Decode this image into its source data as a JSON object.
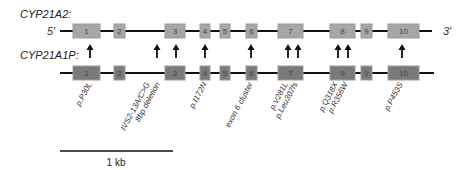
{
  "genes": [
    {
      "name": "CYP21A2:",
      "five_prime": "5'",
      "three_prime": "3'",
      "exon_fill": "#a6a6a6",
      "exon_stroke": "#9a9a9a"
    },
    {
      "name": "CYP21A1P:",
      "exon_fill": "#7a7a7a",
      "exon_stroke": "#9c9c9c"
    }
  ],
  "exons": [
    {
      "label": "1",
      "x": 73,
      "w": 27
    },
    {
      "label": "2",
      "x": 114,
      "w": 11
    },
    {
      "label": "3",
      "x": 165,
      "w": 20
    },
    {
      "label": "4",
      "x": 200,
      "w": 10
    },
    {
      "label": "5",
      "x": 220,
      "w": 10
    },
    {
      "label": "6",
      "x": 246,
      "w": 11
    },
    {
      "label": "7",
      "x": 278,
      "w": 25
    },
    {
      "label": "8",
      "x": 330,
      "w": 25
    },
    {
      "label": "9",
      "x": 361,
      "w": 11
    },
    {
      "label": "10",
      "x": 388,
      "w": 31
    }
  ],
  "pseudo_exon_labels": [
    "1",
    "2",
    "3",
    "4",
    "5",
    "6",
    "7",
    "9",
    "9",
    "10"
  ],
  "arrows_x": [
    90,
    157,
    176,
    205,
    251,
    288,
    298,
    338,
    348,
    402
  ],
  "mutations": [
    {
      "label": "p.P30L",
      "x": 92
    },
    {
      "label": "IVS2-13A/C>G",
      "x": 150
    },
    {
      "label": "8bp deletion",
      "x": 160
    },
    {
      "label": "p.I172N",
      "x": 207
    },
    {
      "label": "exon 6 cluster",
      "x": 253
    },
    {
      "label": "p.V281L",
      "x": 288
    },
    {
      "label": "p.Leu307fs",
      "x": 298
    },
    {
      "label": "p.Q318X",
      "x": 338
    },
    {
      "label": "p.R356W",
      "x": 348
    },
    {
      "label": "p.P453S",
      "x": 403
    }
  ],
  "scale_bar": {
    "label": "1 kb"
  }
}
